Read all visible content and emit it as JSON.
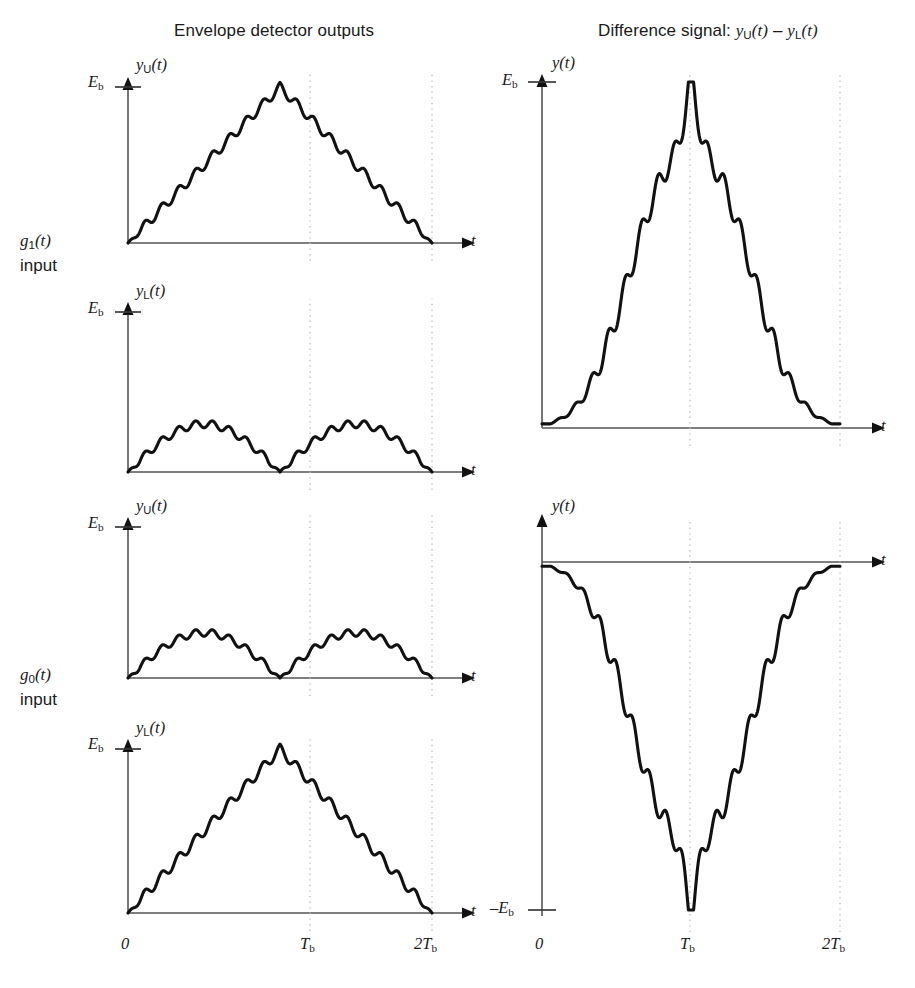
{
  "figure": {
    "width": 915,
    "height": 988,
    "background": "#ffffff",
    "ink": "#111111",
    "axis_color": "#555555",
    "grid_color": "#bbbbbb"
  },
  "titles": {
    "left": "Envelope detector outputs",
    "right_prefix": "Difference signal: ",
    "right_expr_a": "y",
    "right_expr_a_sub": "U",
    "right_expr_a_arg": "(t)",
    "right_minus": " – ",
    "right_expr_b": "y",
    "right_expr_b_sub": "L",
    "right_expr_b_arg": "(t)"
  },
  "group_labels": [
    {
      "name": "g1-input",
      "line1_base": "g",
      "line1_sub": "1",
      "line1_arg": "(t)",
      "line2": "input"
    },
    {
      "name": "g0-input",
      "line1_base": "g",
      "line1_sub": "0",
      "line1_arg": "(t)",
      "line2": "input"
    }
  ],
  "axis_tick_labels": {
    "Eb": "E",
    "Eb_sub": "b",
    "minus_Eb": "–E",
    "minus_Eb_sub": "b",
    "t": "t",
    "zero": "0",
    "Tb": "T",
    "Tb_sub": "b",
    "twoTb": "2T",
    "twoTb_sub": "b"
  },
  "panels": [
    {
      "id": "L1",
      "column": "left",
      "signal": "y",
      "signal_sub": "U",
      "signal_arg": "(t)",
      "yaxis_ticks": [
        "E_b"
      ],
      "waveform": "triangle-up",
      "peak_value": 1.0,
      "peak_at": "Tb"
    },
    {
      "id": "L2",
      "column": "left",
      "signal": "y",
      "signal_sub": "L",
      "signal_arg": "(t)",
      "yaxis_ticks": [
        "E_b"
      ],
      "waveform": "double-hump",
      "peak_value": 0.3,
      "peak_at": "Tb/2, 3Tb/2"
    },
    {
      "id": "L3",
      "column": "left",
      "signal": "y",
      "signal_sub": "U",
      "signal_arg": "(t)",
      "yaxis_ticks": [
        "E_b"
      ],
      "waveform": "double-hump",
      "peak_value": 0.3,
      "peak_at": "Tb/2, 3Tb/2"
    },
    {
      "id": "L4",
      "column": "left",
      "signal": "y",
      "signal_sub": "L",
      "signal_arg": "(t)",
      "yaxis_ticks": [
        "E_b"
      ],
      "waveform": "triangle-up",
      "peak_value": 1.0,
      "peak_at": "Tb"
    },
    {
      "id": "R1",
      "column": "right",
      "signal": "y",
      "signal_sub": "",
      "signal_arg": "(t)",
      "yaxis_ticks": [
        "E_b"
      ],
      "waveform": "difference-positive",
      "peak_value": 1.0,
      "peak_at": "Tb"
    },
    {
      "id": "R2",
      "column": "right",
      "signal": "y",
      "signal_sub": "",
      "signal_arg": "(t)",
      "yaxis_ticks": [
        "-E_b"
      ],
      "waveform": "difference-negative",
      "peak_value": -1.0,
      "peak_at": "Tb"
    }
  ],
  "chart_data": {
    "type": "line",
    "xlabel": "t",
    "ylabel": "amplitude",
    "x_tick_values": [
      0,
      1,
      2
    ],
    "x_tick_labels": [
      "0",
      "Tb",
      "2Tb"
    ],
    "xlim": [
      0,
      2.18
    ],
    "grid": "vertical dotted at Tb and 2Tb",
    "legend": "none",
    "series": [
      {
        "name": "yU(t) for g1(t) input",
        "panel": "L1",
        "ylim": [
          0,
          1.08
        ],
        "y_tick_values": [
          1.0
        ],
        "y_tick_labels": [
          "Eb"
        ],
        "description": "Triangular ramp rising linearly from 0 at t=0 to Eb at t=Tb then falling back to 0 at t=2Tb, with small sinusoidal ripple (about 18 ripple cycles over 2Tb).",
        "x": [
          0.0,
          0.1,
          0.2,
          0.3,
          0.4,
          0.5,
          0.6,
          0.7,
          0.8,
          0.9,
          1.0,
          1.1,
          1.2,
          1.3,
          1.4,
          1.5,
          1.6,
          1.7,
          1.8,
          1.9,
          2.0
        ],
        "y": [
          0.0,
          0.1,
          0.2,
          0.3,
          0.4,
          0.5,
          0.6,
          0.7,
          0.8,
          0.9,
          1.0,
          0.9,
          0.8,
          0.7,
          0.6,
          0.5,
          0.4,
          0.3,
          0.2,
          0.1,
          0.0
        ],
        "ripple_amplitude": 0.035,
        "ripple_cycles": 18
      },
      {
        "name": "yL(t) for g1(t) input",
        "panel": "L2",
        "ylim": [
          0,
          1.08
        ],
        "y_tick_values": [
          1.0
        ],
        "y_tick_labels": [
          "Eb"
        ],
        "description": "Two low humps, each a half-sine reaching about 0.30 Eb, peaking near Tb/2 and 3Tb/2, returning to zero at 0, Tb and 2Tb, with ripple.",
        "x": [
          0.0,
          0.125,
          0.25,
          0.375,
          0.5,
          0.625,
          0.75,
          0.875,
          1.0,
          1.125,
          1.25,
          1.375,
          1.5,
          1.625,
          1.75,
          1.875,
          2.0
        ],
        "y": [
          0.0,
          0.15,
          0.25,
          0.29,
          0.3,
          0.29,
          0.25,
          0.15,
          0.0,
          0.15,
          0.25,
          0.29,
          0.3,
          0.29,
          0.25,
          0.15,
          0.0
        ],
        "ripple_amplitude": 0.028,
        "ripple_cycles": 18
      },
      {
        "name": "yU(t) for g0(t) input",
        "panel": "L3",
        "ylim": [
          0,
          1.08
        ],
        "y_tick_values": [
          1.0
        ],
        "y_tick_labels": [
          "Eb"
        ],
        "description": "Two low humps identical to panel L2: half-sine humps reaching about 0.30 Eb at Tb/2 and 3Tb/2.",
        "x": [
          0.0,
          0.125,
          0.25,
          0.375,
          0.5,
          0.625,
          0.75,
          0.875,
          1.0,
          1.125,
          1.25,
          1.375,
          1.5,
          1.625,
          1.75,
          1.875,
          2.0
        ],
        "y": [
          0.0,
          0.15,
          0.25,
          0.29,
          0.3,
          0.29,
          0.25,
          0.15,
          0.0,
          0.15,
          0.25,
          0.29,
          0.3,
          0.29,
          0.25,
          0.15,
          0.0
        ],
        "ripple_amplitude": 0.028,
        "ripple_cycles": 18
      },
      {
        "name": "yL(t) for g0(t) input",
        "panel": "L4",
        "ylim": [
          0,
          1.08
        ],
        "y_tick_values": [
          1.0
        ],
        "y_tick_labels": [
          "Eb"
        ],
        "description": "Triangular ramp identical to panel L1: rises to Eb at Tb, falls to 0 at 2Tb, with ripple.",
        "x": [
          0.0,
          0.1,
          0.2,
          0.3,
          0.4,
          0.5,
          0.6,
          0.7,
          0.8,
          0.9,
          1.0,
          1.1,
          1.2,
          1.3,
          1.4,
          1.5,
          1.6,
          1.7,
          1.8,
          1.9,
          2.0
        ],
        "y": [
          0.0,
          0.1,
          0.2,
          0.3,
          0.4,
          0.5,
          0.6,
          0.7,
          0.8,
          0.9,
          1.0,
          0.9,
          0.8,
          0.7,
          0.6,
          0.5,
          0.4,
          0.3,
          0.2,
          0.1,
          0.0
        ],
        "ripple_amplitude": 0.035,
        "ripple_cycles": 18
      },
      {
        "name": "y(t) = yU(t) - yL(t) for g1(t) input",
        "panel": "R1",
        "ylim": [
          0,
          1.08
        ],
        "y_tick_values": [
          1.0
        ],
        "y_tick_labels": [
          "Eb"
        ],
        "description": "Positive difference: near zero at t=0 and t=2Tb, rising to a broad bell with a narrow sharp spike reaching Eb exactly at t=Tb; strong ripple on the flanks.",
        "x": [
          0.0,
          0.1,
          0.2,
          0.3,
          0.4,
          0.5,
          0.6,
          0.7,
          0.8,
          0.9,
          0.95,
          1.0,
          1.05,
          1.1,
          1.2,
          1.3,
          1.4,
          1.5,
          1.6,
          1.7,
          1.8,
          1.9,
          2.0
        ],
        "y": [
          0.02,
          0.05,
          0.09,
          0.15,
          0.23,
          0.33,
          0.45,
          0.57,
          0.68,
          0.76,
          0.78,
          1.0,
          0.78,
          0.76,
          0.68,
          0.57,
          0.45,
          0.33,
          0.23,
          0.15,
          0.09,
          0.05,
          0.02
        ],
        "ripple_amplitude": 0.035,
        "ripple_cycles": 18,
        "spike_at": 1.0,
        "spike_value": 1.0
      },
      {
        "name": "y(t) = yU(t) - yL(t) for g0(t) input",
        "panel": "R2",
        "ylim": [
          -1.08,
          0.12
        ],
        "y_tick_values": [
          -1.0
        ],
        "y_tick_labels": [
          "-Eb"
        ],
        "description": "Negative mirror of panel R1: near zero at t=0 and t=2Tb, dipping to a broad negative bell with a narrow sharp spike reaching -Eb exactly at t=Tb.",
        "x": [
          0.0,
          0.1,
          0.2,
          0.3,
          0.4,
          0.5,
          0.6,
          0.7,
          0.8,
          0.9,
          0.95,
          1.0,
          1.05,
          1.1,
          1.2,
          1.3,
          1.4,
          1.5,
          1.6,
          1.7,
          1.8,
          1.9,
          2.0
        ],
        "y": [
          -0.02,
          -0.05,
          -0.09,
          -0.15,
          -0.23,
          -0.33,
          -0.45,
          -0.57,
          -0.68,
          -0.76,
          -0.78,
          -1.0,
          -0.78,
          -0.76,
          -0.68,
          -0.57,
          -0.45,
          -0.33,
          -0.23,
          -0.15,
          -0.09,
          -0.05,
          -0.02
        ],
        "ripple_amplitude": 0.035,
        "ripple_cycles": 18,
        "spike_at": 1.0,
        "spike_value": -1.0
      }
    ]
  },
  "geometry": {
    "left": {
      "x0": 128,
      "xTb": 310,
      "x2Tb": 432,
      "xEnd": 462,
      "baselines": [
        243,
        472,
        678,
        913
      ],
      "tops": [
        80,
        305,
        520,
        742
      ]
    },
    "right": {
      "x0": 542,
      "xTb": 690,
      "x2Tb": 840,
      "xEnd": 872,
      "baselines": [
        428,
        562
      ],
      "tops": [
        78,
        520
      ],
      "bottom": 910
    }
  }
}
